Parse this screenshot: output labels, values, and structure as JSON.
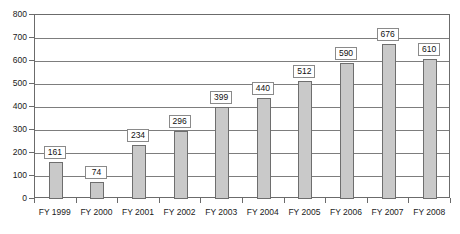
{
  "chart_data": {
    "type": "bar",
    "title": "",
    "subtitle": "",
    "xlabel": "",
    "ylabel": "",
    "categories": [
      "FY 1999",
      "FY 2000",
      "FY 2001",
      "FY 2002",
      "FY 2003",
      "FY 2004",
      "FY 2005",
      "FY 2006",
      "FY 2007",
      "FY 2008"
    ],
    "values": [
      161,
      74,
      234,
      296,
      399,
      440,
      512,
      590,
      676,
      610
    ],
    "data_labels": [
      "161",
      "74",
      "234",
      "296",
      "399",
      "440",
      "512",
      "590",
      "676",
      "610"
    ],
    "ylim": [
      0,
      800
    ],
    "ytick_values": [
      0,
      100,
      200,
      300,
      400,
      500,
      600,
      700,
      800
    ],
    "ytick_labels": [
      "0",
      "100",
      "200",
      "300",
      "400",
      "500",
      "600",
      "700",
      "800"
    ],
    "grid": "horizontal",
    "legend": "none",
    "colors": {
      "bar_fill": "#c9c9c9",
      "bar_border": "#6e6e6e",
      "gridline": "#7d7d7d",
      "axis": "#6b6b6b",
      "label_box_fill": "#ffffff",
      "label_box_border": "#8a8a8a",
      "text": "#1a1a1a"
    }
  }
}
